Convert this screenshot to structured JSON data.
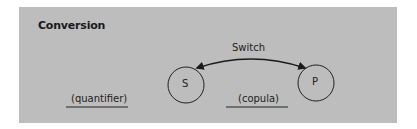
{
  "title": "Conversion",
  "arrow_label": "Switch",
  "nodes": [
    {
      "id": "S",
      "label": "S"
    },
    {
      "id": "P",
      "label": "P"
    }
  ],
  "blanks": [
    {
      "label": "(quantifier)"
    },
    {
      "label": "(copula)"
    }
  ],
  "colors": {
    "panel": "#bdbdbd",
    "stroke": "#1a1a1a"
  }
}
